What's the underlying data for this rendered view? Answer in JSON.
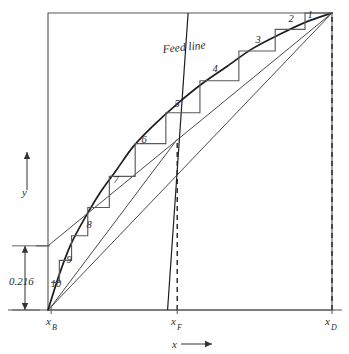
{
  "figure": {
    "background_color": "#ffffff",
    "ink_color": "#333333",
    "frame": {
      "x0": 48,
      "y0": 13,
      "x1": 332,
      "y1": 310
    }
  },
  "axes": {
    "x_axis_label": "x",
    "x_axis_arrow": "⟶",
    "y_axis_label": "y",
    "y_axis_arrow": "↑",
    "x_ticks": [
      {
        "key": "xB",
        "base": "x",
        "sub": "B",
        "px": 51
      },
      {
        "key": "xF",
        "base": "x",
        "sub": "F",
        "px": 177
      },
      {
        "key": "xD",
        "base": "x",
        "sub": "D",
        "px": 332
      }
    ]
  },
  "annotations": {
    "feed_line_label": "Feed line",
    "intercept_label": "0.216"
  },
  "stages": {
    "labels": [
      "1",
      "2",
      "3",
      "4",
      "5",
      "6",
      "7",
      "8",
      "9",
      "10"
    ],
    "count": 10,
    "positions": [
      {
        "label": "1",
        "x": 310,
        "y": 18
      },
      {
        "label": "2",
        "x": 291,
        "y": 22
      },
      {
        "label": "3",
        "x": 258,
        "y": 43
      },
      {
        "label": "4",
        "x": 215,
        "y": 72
      },
      {
        "label": "5",
        "x": 177,
        "y": 107
      },
      {
        "label": "6",
        "x": 144,
        "y": 143
      },
      {
        "label": "7",
        "x": 116,
        "y": 183
      },
      {
        "label": "8",
        "x": 89,
        "y": 228
      },
      {
        "label": "9",
        "x": 69,
        "y": 263
      },
      {
        "label": "10",
        "x": 56,
        "y": 287
      }
    ]
  },
  "chart_data": {
    "type": "line",
    "xlabel": "x",
    "ylabel": "y",
    "xlim": [
      0,
      1
    ],
    "ylim": [
      0,
      1
    ],
    "grid": false,
    "legend": "none",
    "annotations": [
      "Feed line",
      "0.216"
    ],
    "key_compositions": {
      "xB": 0.011,
      "xF": 0.455,
      "xD": 1.0
    },
    "rectifying_intercept": 0.216,
    "number_of_stages": 10,
    "series": [
      {
        "name": "45-degree diagonal",
        "type": "line",
        "x": [
          0,
          1
        ],
        "y": [
          0,
          1
        ]
      },
      {
        "name": "equilibrium curve",
        "type": "line",
        "x": [
          0.0,
          0.04,
          0.08,
          0.13,
          0.18,
          0.24,
          0.3,
          0.37,
          0.45,
          0.54,
          0.63,
          0.72,
          0.82,
          0.91,
          1.0
        ],
        "y": [
          0.0,
          0.12,
          0.22,
          0.31,
          0.39,
          0.47,
          0.55,
          0.62,
          0.69,
          0.76,
          0.82,
          0.88,
          0.93,
          0.97,
          1.0
        ]
      },
      {
        "name": "rectifying operating line",
        "type": "line",
        "x": [
          0.0,
          1.0
        ],
        "y": [
          0.216,
          1.0
        ]
      },
      {
        "name": "stripping operating line",
        "type": "line",
        "x": [
          0.011,
          0.455
        ],
        "y": [
          0.011,
          0.575
        ]
      },
      {
        "name": "feed line (q-line)",
        "type": "line",
        "x": [
          0.425,
          0.492
        ],
        "y": [
          0.0,
          1.0
        ]
      },
      {
        "name": "stage staircase",
        "type": "step",
        "x": [
          1.0,
          0.905,
          0.905,
          0.8,
          0.8,
          0.672,
          0.672,
          0.535,
          0.535,
          0.415,
          0.415,
          0.307,
          0.307,
          0.216,
          0.216,
          0.14,
          0.14,
          0.083,
          0.083,
          0.04,
          0.04,
          0.011
        ],
        "y": [
          1.0,
          1.0,
          0.945,
          0.945,
          0.872,
          0.872,
          0.772,
          0.772,
          0.664,
          0.664,
          0.56,
          0.56,
          0.45,
          0.45,
          0.345,
          0.345,
          0.25,
          0.25,
          0.167,
          0.167,
          0.093,
          0.093
        ]
      }
    ]
  }
}
